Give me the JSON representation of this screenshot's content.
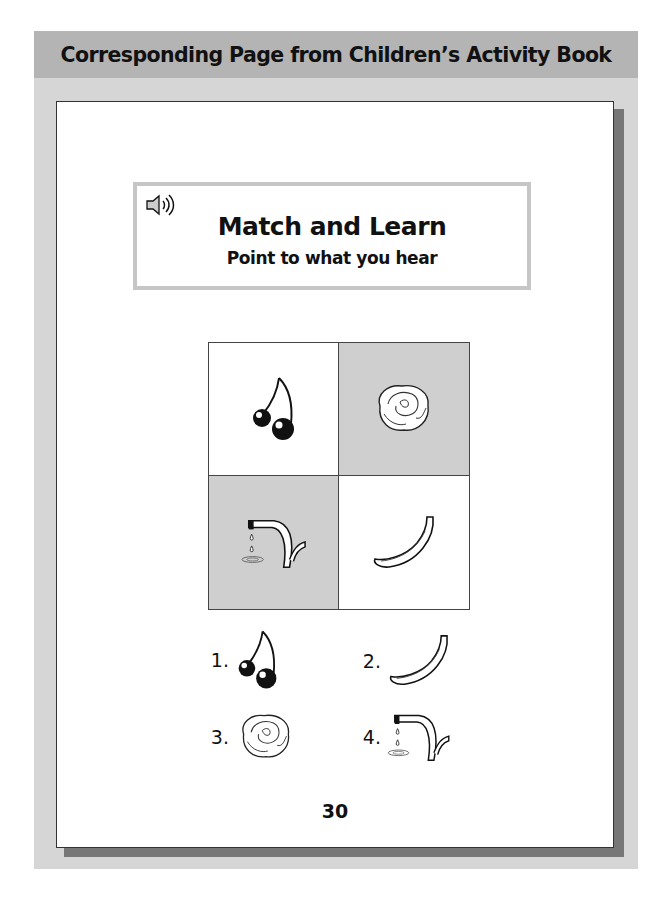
{
  "header": {
    "title": "Corresponding Page from Children’s Activity Book"
  },
  "title_box": {
    "icon": "speaker-icon",
    "title": "Match and Learn",
    "subtitle": "Point to what you hear"
  },
  "grid": {
    "cells": [
      {
        "item": "cherries",
        "shaded": false
      },
      {
        "item": "lettuce",
        "shaded": true
      },
      {
        "item": "dripping-faucet",
        "shaded": true
      },
      {
        "item": "banana",
        "shaded": false
      }
    ]
  },
  "answers": [
    {
      "number": "1.",
      "item": "cherries"
    },
    {
      "number": "2.",
      "item": "banana"
    },
    {
      "number": "3.",
      "item": "lettuce"
    },
    {
      "number": "4.",
      "item": "dripping-faucet"
    }
  ],
  "page_number": "30",
  "colors": {
    "header_bg": "#b4b4b4",
    "panel_bg": "#d6d6d6",
    "shaded_cell": "#cfcfcf"
  }
}
